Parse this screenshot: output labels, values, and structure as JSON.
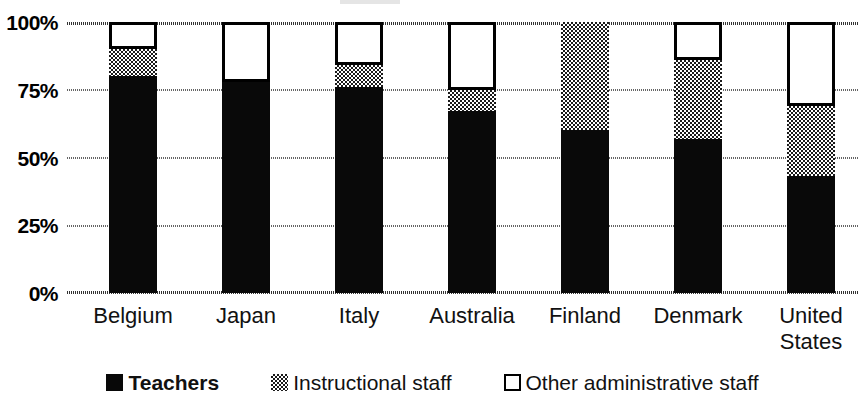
{
  "chart_data": {
    "type": "bar",
    "subtype": "stacked-percentage",
    "title": "",
    "xlabel": "",
    "ylabel": "",
    "ylim": [
      0,
      100
    ],
    "yticks": [
      0,
      25,
      50,
      75,
      100
    ],
    "ytick_labels": [
      "0%",
      "25%",
      "50%",
      "75%",
      "100%"
    ],
    "grid": true,
    "legend_position": "bottom",
    "categories": [
      "Belgium",
      "Japan",
      "Italy",
      "Australia",
      "Finland",
      "Denmark",
      "United States"
    ],
    "category_label_lines": [
      [
        "Belgium"
      ],
      [
        "Japan"
      ],
      [
        "Italy"
      ],
      [
        "Australia"
      ],
      [
        "Finland"
      ],
      [
        "Denmark"
      ],
      [
        "United",
        "States"
      ]
    ],
    "series": [
      {
        "name": "Teachers",
        "fill": "solid-black",
        "color": "#090909",
        "values": [
          80,
          78,
          76,
          67,
          60,
          57,
          43
        ]
      },
      {
        "name": "Instructional staff",
        "fill": "checkered-gray",
        "color": "#808080",
        "values": [
          10,
          0,
          8,
          8,
          40,
          29,
          26
        ]
      },
      {
        "name": "Other administrative staff",
        "fill": "white-outlined",
        "color": "#ffffff",
        "values": [
          10,
          22,
          16,
          25,
          0,
          14,
          31
        ]
      }
    ],
    "stack_tops": {
      "teachers": [
        80,
        78,
        76,
        67,
        60,
        57,
        43
      ],
      "teachers_plus_instructional": [
        90,
        78,
        84,
        75,
        100,
        86,
        69
      ],
      "total": [
        100,
        100,
        100,
        100,
        100,
        100,
        100
      ]
    }
  },
  "legend": {
    "items": [
      {
        "label": "Teachers",
        "swatch": "solid-black-square-icon"
      },
      {
        "label": "Instructional staff",
        "swatch": "checkered-gray-square-icon"
      },
      {
        "label": "Other administrative staff",
        "swatch": "white-outlined-square-icon"
      }
    ]
  }
}
